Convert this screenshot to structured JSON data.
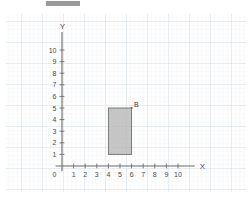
{
  "page": {
    "background_color": "#ffffff",
    "width": 252,
    "height": 200
  },
  "redaction_bar": {
    "label": "",
    "color": "#9a9a9a",
    "x": 46,
    "y": 1,
    "width": 34,
    "height": 5
  },
  "graph_paper": {
    "minor_grid_color": "#e8edf2",
    "major_grid_color": "#ccd7e2",
    "minor_spacing": 4.2,
    "major_spacing": 21
  },
  "chart_data": {
    "type": "scatter",
    "title": "",
    "xlabel": "X",
    "ylabel": "Y",
    "xlim": [
      0,
      11
    ],
    "ylim": [
      0,
      11
    ],
    "grid": true,
    "legend": "none",
    "origin_label": "0",
    "x_ticks": [
      1,
      2,
      3,
      4,
      5,
      6,
      7,
      8,
      9,
      10
    ],
    "y_ticks": [
      1,
      2,
      3,
      4,
      5,
      6,
      7,
      8,
      9,
      10
    ],
    "axis_color": "#6b6b6b",
    "shapes": [
      {
        "name": "rectangle-b",
        "label": "B",
        "type": "rectangle",
        "x_min": 4,
        "x_max": 6,
        "y_min": 1,
        "y_max": 5,
        "width_units": 2,
        "height_units": 4,
        "fill": "#b3b3b3",
        "fill_opacity": 0.75,
        "stroke": "#6e6e6e",
        "label_vertex": [
          6,
          5
        ],
        "vertices": [
          [
            4,
            1
          ],
          [
            6,
            1
          ],
          [
            6,
            5
          ],
          [
            4,
            5
          ]
        ]
      }
    ]
  }
}
